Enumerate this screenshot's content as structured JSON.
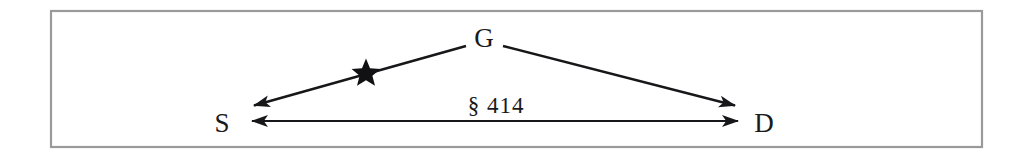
{
  "figure": {
    "caption": "",
    "frame": {
      "name": "diagram-border",
      "x": 50,
      "y": 10,
      "width": 933,
      "height": 138,
      "stroke_color": "#9a9a9a",
      "fill_color": "#ffffff"
    },
    "ink_color": "#17171a",
    "nodes": [
      {
        "id": "G",
        "label": "G",
        "x": 484,
        "y": 47,
        "role": "apex-node"
      },
      {
        "id": "S",
        "label": "S",
        "x": 222,
        "y": 132,
        "role": "left-node"
      },
      {
        "id": "D",
        "label": "D",
        "x": 764,
        "y": 132,
        "role": "right-node"
      }
    ],
    "edges": [
      {
        "id": "g-to-s",
        "from": "G",
        "to": "S",
        "label": "",
        "arrowheads": "end",
        "x1": 466,
        "y1": 46,
        "x2": 252,
        "y2": 106,
        "marker": "star"
      },
      {
        "id": "g-to-d",
        "from": "G",
        "to": "D",
        "label": "",
        "arrowheads": "end",
        "x1": 503,
        "y1": 46,
        "x2": 737,
        "y2": 106,
        "marker": "none"
      },
      {
        "id": "s-to-d",
        "from": "S",
        "to": "D",
        "label": "§ 414",
        "arrowheads": "both",
        "x1": 246,
        "y1": 121,
        "x2": 744,
        "y2": 121,
        "marker": "none"
      }
    ],
    "markers": [
      {
        "id": "star-on-g-to-s",
        "type": "star",
        "x": 366,
        "y": 72,
        "radius": 13,
        "color": "#111114"
      }
    ],
    "edge_label": {
      "text": "§ 414",
      "x": 496,
      "y": 113
    }
  }
}
